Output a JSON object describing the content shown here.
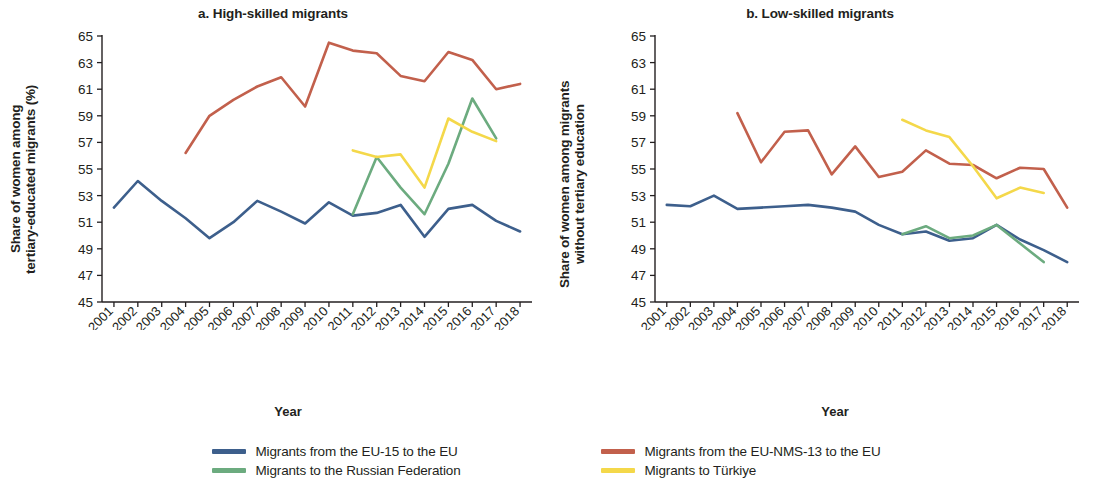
{
  "figure": {
    "panels": [
      {
        "id": "a",
        "title": "a. High-skilled migrants",
        "ylabel": "Share of women among\ntertiary-educated migrants (%)",
        "xlabel": "Year"
      },
      {
        "id": "b",
        "title": "b. Low-skilled migrants",
        "ylabel": "Share of women among migrants\nwithout tertiary education",
        "xlabel": "Year"
      }
    ]
  },
  "legend": {
    "position": "bottom-center",
    "items": [
      {
        "label": "Migrants from the EU-15 to the EU",
        "color": "#3d5f8c"
      },
      {
        "label": "Migrants from the EU-NMS-13 to the EU",
        "color": "#c2604c"
      },
      {
        "label": "Migrants to the Russian Federation",
        "color": "#6cab7f"
      },
      {
        "label": "Migrants to Türkiye",
        "color": "#f4d84a"
      }
    ]
  },
  "colors": {
    "eu15": "#3d5f8c",
    "eunms13": "#c2604c",
    "russia": "#6cab7f",
    "turkiye": "#f4d84a",
    "axis": "#231f20",
    "text": "#231f20",
    "background": "#ffffff"
  },
  "chart_data": [
    {
      "type": "line",
      "panel": "a",
      "title": "a. High-skilled migrants",
      "xlabel": "Year",
      "ylabel": "Share of women among tertiary-educated migrants (%)",
      "x": [
        2001,
        2002,
        2003,
        2004,
        2005,
        2006,
        2007,
        2008,
        2009,
        2010,
        2011,
        2012,
        2013,
        2014,
        2015,
        2016,
        2017,
        2018
      ],
      "xtick_labels": [
        "2001",
        "2002",
        "2003",
        "2004",
        "2005",
        "2006",
        "2007",
        "2008",
        "2009",
        "2010",
        "2011",
        "2012",
        "2013",
        "2014",
        "2015",
        "2016",
        "2017",
        "2018"
      ],
      "ylim": [
        45,
        65
      ],
      "ytick_labels": [
        "45",
        "47",
        "49",
        "51",
        "53",
        "55",
        "57",
        "59",
        "61",
        "63",
        "65"
      ],
      "yticks": [
        45,
        47,
        49,
        51,
        53,
        55,
        57,
        59,
        61,
        63,
        65
      ],
      "grid": false,
      "series": [
        {
          "name": "Migrants from the EU-15 to the EU",
          "color": "#3d5f8c",
          "values": [
            52.1,
            54.1,
            52.6,
            51.3,
            49.8,
            51.0,
            52.6,
            51.8,
            50.9,
            52.5,
            51.5,
            51.7,
            52.3,
            49.9,
            52.0,
            52.3,
            51.1,
            50.3
          ]
        },
        {
          "name": "Migrants from the EU-NMS-13 to the EU",
          "color": "#c2604c",
          "values": [
            null,
            null,
            null,
            56.2,
            59.0,
            60.2,
            61.2,
            61.9,
            59.7,
            64.5,
            63.9,
            63.7,
            62.0,
            61.6,
            63.8,
            63.2,
            61.0,
            61.4
          ]
        },
        {
          "name": "Migrants to the Russian Federation",
          "color": "#6cab7f",
          "values": [
            null,
            null,
            null,
            null,
            null,
            null,
            null,
            null,
            null,
            null,
            51.6,
            55.9,
            53.6,
            51.6,
            55.4,
            60.3,
            57.3,
            null
          ]
        },
        {
          "name": "Migrants to Türkiye",
          "color": "#f4d84a",
          "values": [
            null,
            null,
            null,
            null,
            null,
            null,
            null,
            null,
            null,
            null,
            56.4,
            55.9,
            56.1,
            53.6,
            58.8,
            57.8,
            57.1,
            null
          ]
        }
      ]
    },
    {
      "type": "line",
      "panel": "b",
      "title": "b. Low-skilled migrants",
      "xlabel": "Year",
      "ylabel": "Share of women among migrants without tertiary education",
      "x": [
        2001,
        2002,
        2003,
        2004,
        2005,
        2006,
        2007,
        2008,
        2009,
        2010,
        2011,
        2012,
        2013,
        2014,
        2015,
        2016,
        2017,
        2018
      ],
      "xtick_labels": [
        "2001",
        "2002",
        "2003",
        "2004",
        "2005",
        "2006",
        "2007",
        "2008",
        "2009",
        "2010",
        "2011",
        "2012",
        "2013",
        "2014",
        "2015",
        "2016",
        "2017",
        "2018"
      ],
      "ylim": [
        45,
        65
      ],
      "ytick_labels": [
        "45",
        "47",
        "49",
        "51",
        "53",
        "55",
        "57",
        "59",
        "61",
        "63",
        "65"
      ],
      "yticks": [
        45,
        47,
        49,
        51,
        53,
        55,
        57,
        59,
        61,
        63,
        65
      ],
      "grid": false,
      "series": [
        {
          "name": "Migrants from the EU-15 to the EU",
          "color": "#3d5f8c",
          "values": [
            52.3,
            52.2,
            53.0,
            52.0,
            52.1,
            52.2,
            52.3,
            52.1,
            51.8,
            50.8,
            50.1,
            50.3,
            49.6,
            49.8,
            50.8,
            49.7,
            48.9,
            48.0
          ]
        },
        {
          "name": "Migrants from the EU-NMS-13 to the EU",
          "color": "#c2604c",
          "values": [
            null,
            null,
            null,
            59.2,
            55.5,
            57.8,
            57.9,
            54.6,
            56.7,
            54.4,
            54.8,
            56.4,
            55.4,
            55.3,
            54.3,
            55.1,
            55.0,
            52.1
          ]
        },
        {
          "name": "Migrants to the Russian Federation",
          "color": "#6cab7f",
          "values": [
            null,
            null,
            null,
            null,
            null,
            null,
            null,
            null,
            null,
            null,
            50.1,
            50.7,
            49.8,
            50.0,
            50.8,
            49.4,
            48.0,
            null
          ]
        },
        {
          "name": "Migrants to Türkiye",
          "color": "#f4d84a",
          "values": [
            null,
            null,
            null,
            null,
            null,
            null,
            null,
            null,
            null,
            null,
            58.7,
            57.9,
            57.4,
            55.2,
            52.8,
            53.6,
            53.2,
            null
          ]
        }
      ]
    }
  ]
}
